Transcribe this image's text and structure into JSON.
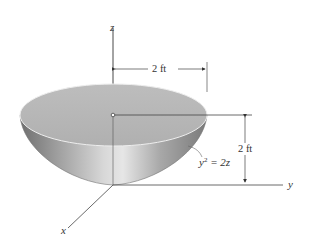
{
  "figure": {
    "type": "paraboloid-bowl",
    "axes": {
      "x": "x",
      "y": "y",
      "z": "z"
    },
    "dimensions": {
      "radius_label": "2 ft",
      "height_label": "2 ft"
    },
    "equation": {
      "base": "y",
      "exp": "2",
      "rhs": " = 2z"
    },
    "colors": {
      "surface_light": "#d4d4d4",
      "surface_dark": "#8a8a8a",
      "rim_top": "#bdbdbd",
      "line": "#444444"
    }
  }
}
